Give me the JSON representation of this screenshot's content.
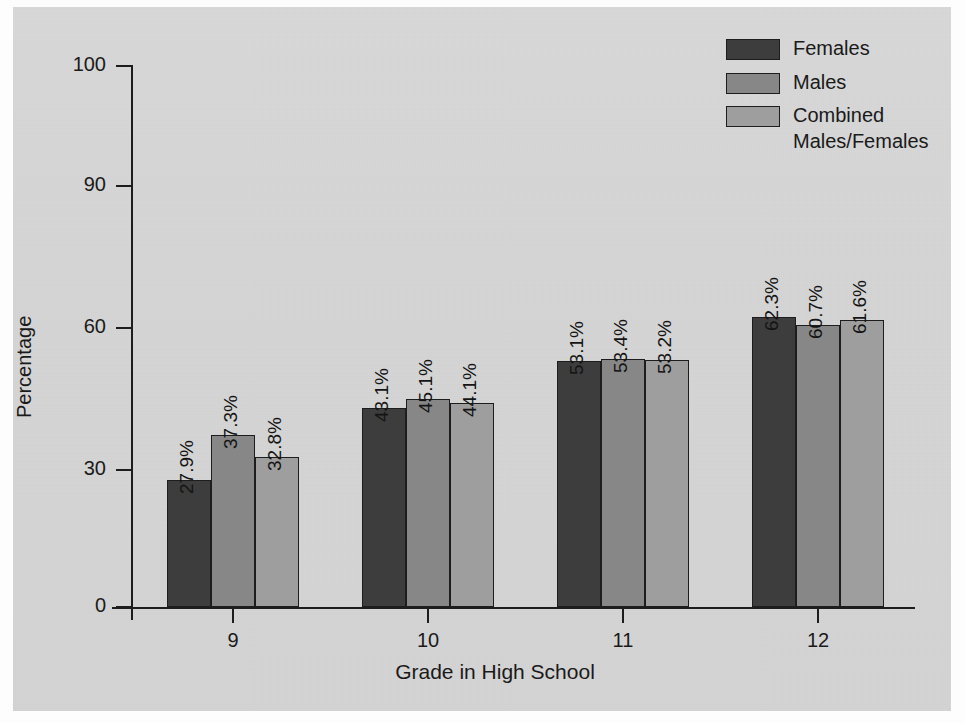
{
  "chart_data": {
    "type": "bar",
    "title": "",
    "xlabel": "Grade in High School",
    "ylabel": "Percentage",
    "categories": [
      "9",
      "10",
      "11",
      "12"
    ],
    "series": [
      {
        "name": "Females",
        "color": "#3d3d3d",
        "values": [
          27.9,
          43.1,
          53.1,
          62.3
        ],
        "labels": [
          "27.9%",
          "43.1%",
          "53.1%",
          "62.3%"
        ]
      },
      {
        "name": "Males",
        "color": "#878787",
        "values": [
          37.3,
          45.1,
          53.4,
          60.7
        ],
        "labels": [
          "37.3%",
          "45.1%",
          "53.4%",
          "60.7%"
        ]
      },
      {
        "name": "Combined\nMales/Females",
        "color": "#9e9e9e",
        "values": [
          32.8,
          44.1,
          53.2,
          61.6
        ],
        "labels": [
          "32.8%",
          "44.1%",
          "53.2%",
          "61.6%"
        ]
      }
    ],
    "yticks": [
      0,
      30,
      60,
      90,
      100
    ],
    "ytick_labels": [
      "0",
      "30",
      "60",
      "90",
      "100"
    ],
    "ylim": [
      0,
      100
    ],
    "y_axis_note": "non-uniform (broken) scale: 0, 30, 60, 90, 100",
    "grid": false,
    "legend_position": "top-right"
  },
  "legend": {
    "entries": [
      {
        "label": "Females",
        "color": "#3d3d3d"
      },
      {
        "label": "Males",
        "color": "#878787"
      },
      {
        "label": "Combined\nMales/Females",
        "color": "#9e9e9e"
      }
    ]
  },
  "axes": {
    "x_title": "Grade in High School",
    "y_title": "Percentage"
  }
}
